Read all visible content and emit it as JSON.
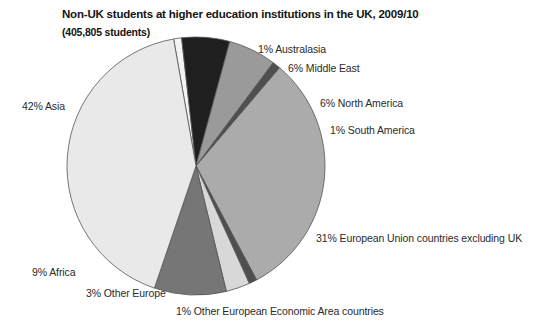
{
  "chart": {
    "title": "Non-UK students at higher education institutions in the UK, 2009/10",
    "subtitle": "(405,805 students)"
  },
  "chart_data": {
    "type": "pie",
    "title": "Non-UK students at higher education institutions in the UK, 2009/10",
    "subtitle": "(405,805 students)",
    "total_label": "405,805 students",
    "total_value": 405805,
    "unit": "%",
    "legend": "none",
    "grid": false,
    "labels": [
      "Australasia",
      "Middle East",
      "North America",
      "South America",
      "European Union countries excluding UK",
      "Other European Economic Area countries",
      "Other Europe",
      "Africa",
      "Asia"
    ],
    "values": [
      1,
      6,
      6,
      1,
      31,
      1,
      3,
      9,
      42
    ],
    "colors": [
      "#f3f3f3",
      "#1f1f1f",
      "#9a9a9a",
      "#4f4f4f",
      "#ababab",
      "#4f4f4f",
      "#d8d8d8",
      "#767676",
      "#e9e9e9"
    ],
    "slices": [
      {
        "label": "1% Australasia",
        "name": "Australasia",
        "value": 1,
        "color": "#f3f3f3",
        "start_deg": -10,
        "end_deg": -6.4
      },
      {
        "label": "6% Middle East",
        "name": "Middle East",
        "value": 6,
        "color": "#1f1f1f",
        "start_deg": -6.4,
        "end_deg": 15.2
      },
      {
        "label": "6% North America",
        "name": "North America",
        "value": 6,
        "color": "#9a9a9a",
        "start_deg": 15.2,
        "end_deg": 36.8
      },
      {
        "label": "1% South America",
        "name": "South America",
        "value": 1,
        "color": "#4f4f4f",
        "start_deg": 36.8,
        "end_deg": 40.4
      },
      {
        "label": "31% European Union countries excluding UK",
        "name": "European Union countries excluding UK",
        "value": 31,
        "color": "#ababab",
        "start_deg": 40.4,
        "end_deg": 152
      },
      {
        "label": "1% Other European Economic Area countries",
        "name": "Other European Economic Area countries",
        "value": 1,
        "color": "#4f4f4f",
        "start_deg": 152,
        "end_deg": 155.6
      },
      {
        "label": "3% Other Europe",
        "name": "Other Europe",
        "value": 3,
        "color": "#d8d8d8",
        "start_deg": 155.6,
        "end_deg": 166.4
      },
      {
        "label": "9% Africa",
        "name": "Africa",
        "value": 9,
        "color": "#767676",
        "start_deg": 166.4,
        "end_deg": 198.8
      },
      {
        "label": "42% Asia",
        "name": "Asia",
        "value": 42,
        "color": "#e9e9e9",
        "start_deg": 198.8,
        "end_deg": 350
      }
    ]
  },
  "labels": {
    "australasia": "1% Australasia",
    "middle_east": "6% Middle East",
    "north_america": "6% North America",
    "south_america": "1% South America",
    "eu": "31% European Union countries excluding UK",
    "other_eea": "1% Other European Economic Area countries",
    "other_europe": "3% Other Europe",
    "africa": "9% Africa",
    "asia": "42% Asia"
  }
}
